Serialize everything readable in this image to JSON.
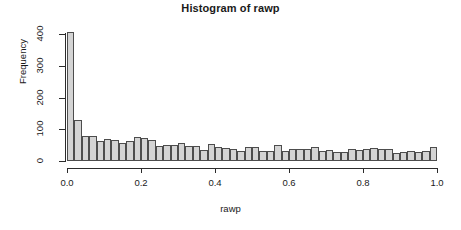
{
  "chart_data": {
    "type": "bar",
    "title": "Histogram of rawp",
    "xlabel": "rawp",
    "ylabel": "Frequency",
    "xlim": [
      0.0,
      1.0
    ],
    "ylim": [
      0,
      420
    ],
    "grid": false,
    "legend": null,
    "bin_width": 0.02,
    "x_tick_labels": [
      "0.0",
      "0.2",
      "0.4",
      "0.6",
      "0.8",
      "1.0"
    ],
    "x_tick_values": [
      0.0,
      0.2,
      0.4,
      0.6,
      0.8,
      1.0
    ],
    "y_tick_labels": [
      "0",
      "100",
      "200",
      "300",
      "400"
    ],
    "y_tick_values": [
      0,
      100,
      200,
      300,
      400
    ],
    "bar_fill_color": "#d4d4d4",
    "bar_border_color": "#4d4d4d",
    "bin_edges": [
      0.0,
      0.02,
      0.04,
      0.06,
      0.08,
      0.1,
      0.12,
      0.14,
      0.16,
      0.18,
      0.2,
      0.22,
      0.24,
      0.26,
      0.28,
      0.3,
      0.32,
      0.34,
      0.36,
      0.38,
      0.4,
      0.42,
      0.44,
      0.46,
      0.48,
      0.5,
      0.52,
      0.54,
      0.56,
      0.58,
      0.6,
      0.62,
      0.64,
      0.66,
      0.68,
      0.7,
      0.72,
      0.74,
      0.76,
      0.78,
      0.8,
      0.82,
      0.84,
      0.86,
      0.88,
      0.9,
      0.92,
      0.94,
      0.96,
      0.98,
      1.0
    ],
    "categories": [
      "0.00-0.02",
      "0.02-0.04",
      "0.04-0.06",
      "0.06-0.08",
      "0.08-0.10",
      "0.10-0.12",
      "0.12-0.14",
      "0.14-0.16",
      "0.16-0.18",
      "0.18-0.20",
      "0.20-0.22",
      "0.22-0.24",
      "0.24-0.26",
      "0.26-0.28",
      "0.28-0.30",
      "0.30-0.32",
      "0.32-0.34",
      "0.34-0.36",
      "0.36-0.38",
      "0.38-0.40",
      "0.40-0.42",
      "0.42-0.44",
      "0.44-0.46",
      "0.46-0.48",
      "0.48-0.50",
      "0.50-0.52",
      "0.52-0.54",
      "0.54-0.56",
      "0.56-0.58",
      "0.58-0.60",
      "0.60-0.62",
      "0.62-0.64",
      "0.64-0.66",
      "0.66-0.68",
      "0.68-0.70",
      "0.70-0.72",
      "0.72-0.74",
      "0.74-0.76",
      "0.76-0.78",
      "0.78-0.80",
      "0.80-0.82",
      "0.82-0.84",
      "0.84-0.86",
      "0.86-0.88",
      "0.88-0.90",
      "0.90-0.92",
      "0.92-0.94",
      "0.94-0.96",
      "0.96-0.98",
      "0.98-1.00"
    ],
    "values": [
      405,
      130,
      78,
      79,
      62,
      68,
      67,
      58,
      62,
      75,
      72,
      65,
      48,
      50,
      52,
      56,
      48,
      46,
      34,
      55,
      45,
      42,
      37,
      32,
      44,
      43,
      32,
      31,
      49,
      30,
      37,
      39,
      38,
      43,
      32,
      36,
      28,
      29,
      39,
      36,
      38,
      41,
      39,
      37,
      24,
      27,
      31,
      29,
      33,
      45
    ]
  }
}
